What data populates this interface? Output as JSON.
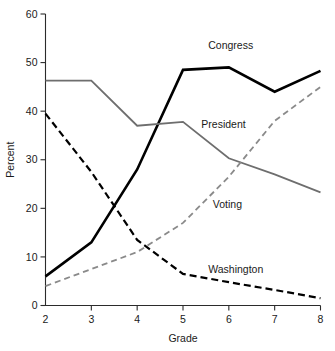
{
  "chart_data": {
    "type": "line",
    "title": "",
    "xlabel": "Grade",
    "ylabel": "Percent",
    "x": [
      2,
      3,
      4,
      5,
      6,
      7,
      8
    ],
    "xlim": [
      2,
      8
    ],
    "ylim": [
      0,
      60
    ],
    "xticks": [
      "2",
      "3",
      "4",
      "5",
      "6",
      "7",
      "8"
    ],
    "yticks": [
      "0",
      "10",
      "20",
      "30",
      "40",
      "50",
      "60"
    ],
    "grid": false,
    "legend": "inline-labels",
    "series": [
      {
        "name": "Congress",
        "values": [
          6,
          13,
          28,
          48.5,
          49,
          44,
          48.3
        ],
        "color": "#000000",
        "style": "solid",
        "width": 2.6,
        "label_x": 5.55,
        "label_y": 53.5
      },
      {
        "name": "President",
        "values": [
          46.3,
          46.3,
          37,
          37.8,
          30.3,
          27,
          23.3
        ],
        "color": "#6e6e6e",
        "style": "solid",
        "width": 1.8,
        "label_x": 5.4,
        "label_y": 37.2
      },
      {
        "name": "Voting",
        "values": [
          4,
          7.5,
          11,
          17,
          26.5,
          38,
          45
        ],
        "color": "#8a8a8a",
        "style": "dashed",
        "width": 1.8,
        "label_x": 5.65,
        "label_y": 20.8
      },
      {
        "name": "Washington",
        "values": [
          39.5,
          27.5,
          13.5,
          6.5,
          4.8,
          3.2,
          1.5
        ],
        "color": "#000000",
        "style": "dashed",
        "width": 2.2,
        "label_x": 5.55,
        "label_y": 7.5
      }
    ]
  }
}
